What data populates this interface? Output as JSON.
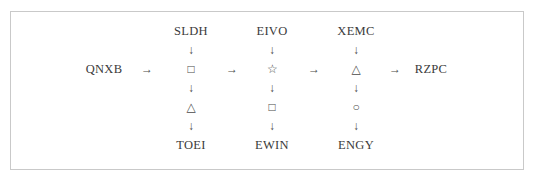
{
  "diagram": {
    "type": "flow-chain",
    "title": "",
    "border_color": "#c9c9c9",
    "text_color": "#3a3a3a",
    "background": "#ffffff",
    "source_node": "QNXB",
    "target_node": "RZPC",
    "right_arrow": "→",
    "down_arrow": "↓",
    "columns": [
      {
        "id": "col-a",
        "top_label": "SLDH",
        "middle_symbol": "□",
        "middle_symbol_name": "square",
        "lower_symbol": "△",
        "lower_symbol_name": "triangle",
        "bottom_label": "TOEI"
      },
      {
        "id": "col-b",
        "top_label": "EIVO",
        "middle_symbol": "☆",
        "middle_symbol_name": "star",
        "lower_symbol": "□",
        "lower_symbol_name": "square",
        "bottom_label": "EWIN"
      },
      {
        "id": "col-c",
        "top_label": "XEMC",
        "middle_symbol": "△",
        "middle_symbol_name": "triangle",
        "lower_symbol": "○",
        "lower_symbol_name": "circle",
        "bottom_label": "ENGY"
      }
    ]
  }
}
